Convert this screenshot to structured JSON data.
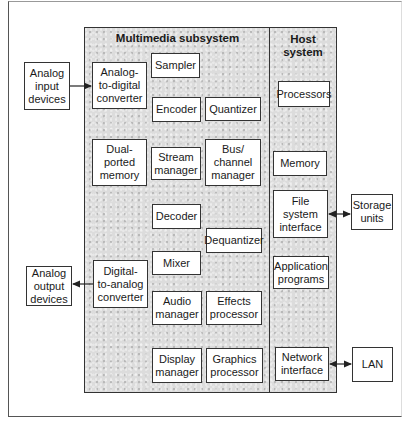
{
  "diagram": {
    "regions": {
      "multimedia": {
        "title": "Multimedia subsystem"
      },
      "host": {
        "title": "Host\nsystem"
      }
    },
    "external": {
      "analog_input": "Analog\ninput\ndevices",
      "analog_output": "Analog\noutput\ndevices",
      "storage": "Storage\nunits",
      "lan": "LAN"
    },
    "multimedia_blocks": {
      "adc": "Analog-\nto-digital\nconverter",
      "sampler": "Sampler",
      "encoder": "Encoder",
      "quantizer": "Quantizer",
      "dual_memory": "Dual-\nported\nmemory",
      "stream_manager": "Stream\nmanager",
      "bus_manager": "Bus/\nchannel\nmanager",
      "decoder": "Decoder",
      "dequantizer": "Dequantizer",
      "mixer": "Mixer",
      "dac": "Digital-\nto-analog\nconverter",
      "audio_manager": "Audio\nmanager",
      "effects_processor": "Effects\nprocessor",
      "display_manager": "Display\nmanager",
      "graphics_processor": "Graphics\nprocessor"
    },
    "host_blocks": {
      "processors": "Processors",
      "memory": "Memory",
      "fs_interface": "File\nsystem\ninterface",
      "app_programs": "Application\nprograms",
      "net_interface": "Network\ninterface"
    },
    "connections": [
      {
        "from": "Analog input devices",
        "to": "Analog-to-digital converter",
        "type": "one-way"
      },
      {
        "from": "Digital-to-analog converter",
        "to": "Analog output devices",
        "type": "one-way"
      },
      {
        "from": "File system interface",
        "to": "Storage units",
        "type": "two-way"
      },
      {
        "from": "Network interface",
        "to": "LAN",
        "type": "two-way"
      }
    ]
  }
}
